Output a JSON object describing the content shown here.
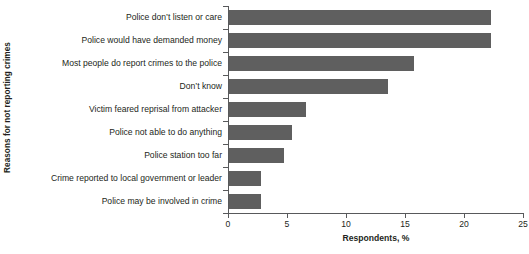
{
  "chart_data": {
    "type": "bar",
    "orientation": "horizontal",
    "title": "",
    "xlabel": "Respondents, %",
    "ylabel": "Reasons for not reporting crimes",
    "xlim": [
      0,
      25
    ],
    "xticks": [
      0,
      5,
      10,
      15,
      20,
      25
    ],
    "xtick_labels": [
      "0",
      "5",
      "10",
      "15",
      "20",
      "25"
    ],
    "grid": false,
    "legend": null,
    "bar_color": "#5f5f5f",
    "axis_color": "#58595b",
    "categories": [
      "Police don’t listen or care",
      "Police would have demanded money",
      "Most people do report crimes to the police",
      "Don’t know",
      "Victim feared reprisal from attacker",
      "Police not able to do anything",
      "Police station too far",
      "Crime reported to local government or leader",
      "Police may be involved in crime"
    ],
    "values": [
      22.2,
      22.2,
      15.7,
      13.5,
      6.5,
      5.3,
      4.7,
      2.7,
      2.7
    ]
  }
}
